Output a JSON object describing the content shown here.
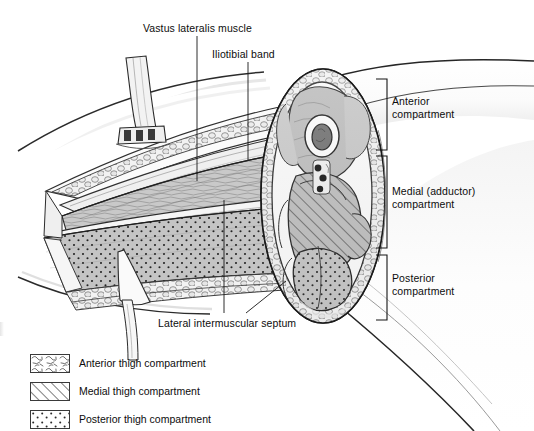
{
  "figure": {
    "style": "grayscale pen-and-ink medical illustration",
    "callouts": [
      {
        "id": "vastus",
        "label": "Vastus lateralis muscle",
        "leader": "vertical line down to anterior thigh muscle belly"
      },
      {
        "id": "itb",
        "label": "Iliotibial band",
        "leader": "vertical line down to fascial band"
      },
      {
        "id": "septum",
        "label": "Lateral intermuscular septum",
        "leader": "two lines up into the cut fascia"
      }
    ],
    "brackets": [
      {
        "id": "anterior",
        "label_line1": "Anterior",
        "label_line2": "compartment"
      },
      {
        "id": "medial",
        "label_line1": "Medial (adductor)",
        "label_line2": "compartment"
      },
      {
        "id": "posterior",
        "label_line1": "Posterior",
        "label_line2": "compartment"
      }
    ]
  },
  "legend": {
    "items": [
      {
        "pattern": "scribble",
        "label": "Anterior thigh compartment"
      },
      {
        "pattern": "diagonal-hatch",
        "label": "Medial thigh compartment"
      },
      {
        "pattern": "dot-stipple",
        "label": "Posterior thigh compartment"
      }
    ]
  },
  "colors": {
    "ink": "#111111",
    "line": "#2a2a2a",
    "paper": "#ffffff",
    "fat_fill": "#ededed",
    "muscle_mid": "#b9b9b9",
    "muscle_dark": "#8f8f8f",
    "bone_cortex": "#f7f7f7",
    "marrow": "#6a6a6a",
    "vessel": "#1a1a1a"
  },
  "cross_section": {
    "structures": [
      "subcutaneous fat lobules ring",
      "femur with cortical ring and marrow cavity",
      "anterior (quadriceps) muscle group",
      "medial adductor muscle group, hatched",
      "posterior hamstring muscle group, stippled",
      "neurovascular bundle"
    ]
  }
}
